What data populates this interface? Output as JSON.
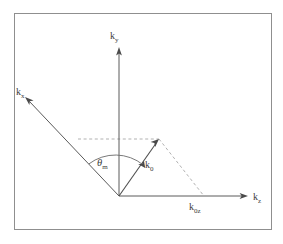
{
  "figure": {
    "kind": "vector-diagram",
    "frame": {
      "x": 14,
      "y": 13,
      "width": 258,
      "height": 217,
      "stroke": "#8f8f8f"
    },
    "origin": {
      "x": 119,
      "y": 196
    },
    "colors": {
      "axis": "#5a5a5a",
      "vector": "#4f4f4f",
      "dashed": "#a8a8a8",
      "arrowhead": "#4a4a4a",
      "label": "#3d3d3d",
      "background": "#ffffff"
    },
    "axes": [
      {
        "id": "ky",
        "base": "k",
        "subscript": "y",
        "label": "k_y",
        "from": {
          "x": 119,
          "y": 196
        },
        "to": {
          "x": 119,
          "y": 48
        },
        "label_pos": {
          "x": 110,
          "y": 38
        },
        "arrow": "up"
      },
      {
        "id": "kx",
        "base": "k",
        "subscript": "x",
        "label": "k_x",
        "from": {
          "x": 119,
          "y": 196
        },
        "to": {
          "x": 25,
          "y": 97
        },
        "label_pos": {
          "x": 16,
          "y": 92
        },
        "arrow": "up-left"
      },
      {
        "id": "kz",
        "base": "k",
        "subscript": "z",
        "label": "k_z",
        "from": {
          "x": 119,
          "y": 196
        },
        "to": {
          "x": 248,
          "y": 196
        },
        "label_pos": {
          "x": 253,
          "y": 199
        },
        "arrow": "right"
      }
    ],
    "vectors": [
      {
        "id": "k0",
        "base": "k",
        "subscript": "0",
        "label": "k_0",
        "from": {
          "x": 119,
          "y": 196
        },
        "to": {
          "x": 159,
          "y": 139
        },
        "label_pos": {
          "x": 145,
          "y": 166
        },
        "arrow": "up-right"
      }
    ],
    "projections": [
      {
        "id": "k0z",
        "base": "k",
        "subscript": "0z",
        "label": "k_0z",
        "label_pos": {
          "x": 189,
          "y": 208
        },
        "dashed_from": {
          "x": 159,
          "y": 139
        },
        "dashed_to": {
          "x": 204,
          "y": 196
        }
      },
      {
        "id": "horizontal-guide",
        "label": "",
        "dashed_from": {
          "x": 78,
          "y": 139
        },
        "dashed_to": {
          "x": 159,
          "y": 139
        }
      }
    ],
    "angle": {
      "id": "theta-m",
      "symbol": "θ",
      "subscript": "m",
      "label": "θ_m",
      "label_pos": {
        "x": 97,
        "y": 166
      },
      "vertex": {
        "x": 119,
        "y": 196
      },
      "from_deg": 133,
      "to_deg": 55,
      "radius": 44,
      "arc_arrow": "toward-k0"
    }
  }
}
